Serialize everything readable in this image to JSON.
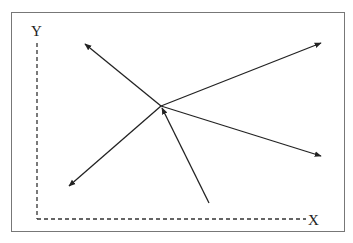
{
  "diagram": {
    "type": "vector-diagram",
    "axes": {
      "x_label": "X",
      "y_label": "Y",
      "style": "dashed"
    },
    "center_point": [
      161,
      106
    ],
    "arrows": [
      {
        "id": "upper-left",
        "from": [
          161,
          106
        ],
        "to": [
          85,
          44
        ],
        "direction": "outward"
      },
      {
        "id": "upper-right",
        "from": [
          161,
          106
        ],
        "to": [
          321,
          43
        ],
        "direction": "outward"
      },
      {
        "id": "right",
        "from": [
          161,
          106
        ],
        "to": [
          321,
          156
        ],
        "direction": "outward"
      },
      {
        "id": "lower-left",
        "from": [
          161,
          106
        ],
        "to": [
          69,
          186
        ],
        "direction": "outward"
      },
      {
        "id": "bottom-incoming",
        "from": [
          209,
          203
        ],
        "to": [
          162,
          108
        ],
        "direction": "inward"
      }
    ],
    "colors": {
      "frame": "#777777",
      "line": "#222222",
      "axis": "#333333"
    }
  }
}
